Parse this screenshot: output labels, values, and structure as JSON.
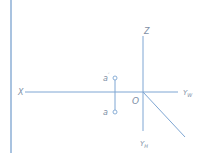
{
  "diagram": {
    "type": "orthographic-projection-axes",
    "colors": {
      "line": "#7ea6d3",
      "edge": "#a9c3e0",
      "label": "#7e8fa6",
      "background": "#ffffff"
    },
    "labels": {
      "x_axis": "X",
      "z_axis": "Z",
      "y_w_axis": "Y",
      "y_w_sub": "W",
      "y_h_axis": "Y",
      "y_h_sub": "H",
      "origin": "O",
      "point_front": "a",
      "point_front_mark": "′",
      "point_top": "a"
    }
  }
}
